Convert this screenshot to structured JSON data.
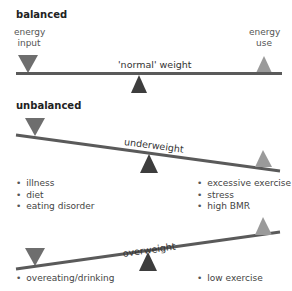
{
  "colors": {
    "beam": "#5a5a5a",
    "input_triangle": "#6e6e6e",
    "use_triangle": "#9a9a9a",
    "fulcrum": "#3d3d3d"
  },
  "balanced": {
    "heading": "balanced",
    "input_label_line1": "energy",
    "input_label_line2": "input",
    "use_label_line1": "energy",
    "use_label_line2": "use",
    "beam_label": "'normal' weight"
  },
  "unbalanced": {
    "heading": "unbalanced",
    "underweight": {
      "beam_label": "underweight",
      "left_causes": [
        "illness",
        "diet",
        "eating disorder"
      ],
      "right_causes": [
        "excessive exercise",
        "stress",
        "high BMR"
      ]
    },
    "overweight": {
      "beam_label": "overweight",
      "left_causes": [
        "overeating/drinking"
      ],
      "right_causes": [
        "low exercise"
      ]
    }
  }
}
